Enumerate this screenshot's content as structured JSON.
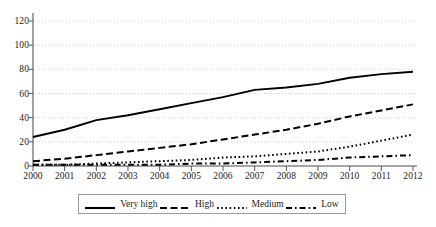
{
  "chart_data": {
    "type": "line",
    "title": "",
    "xlabel": "",
    "ylabel": "",
    "categories": [
      "2000",
      "2001",
      "2002",
      "2003",
      "2004",
      "2005",
      "2006",
      "2007",
      "2008",
      "2009",
      "2010",
      "2011",
      "2012"
    ],
    "x": [
      2000,
      2001,
      2002,
      2003,
      2004,
      2005,
      2006,
      2007,
      2008,
      2009,
      2010,
      2011,
      2012
    ],
    "xlim": [
      2000,
      2012
    ],
    "ylim": [
      0,
      120
    ],
    "yticks": [
      0,
      20,
      40,
      60,
      80,
      100,
      120
    ],
    "grid": "horizontal-dotted",
    "legend_position": "bottom",
    "series": [
      {
        "name": "Very high",
        "style": "solid",
        "color": "#000000",
        "values": [
          24,
          30,
          38,
          42,
          47,
          52,
          57,
          63,
          65,
          68,
          73,
          76,
          78
        ]
      },
      {
        "name": "High",
        "style": "dashed",
        "color": "#000000",
        "values": [
          4,
          6,
          9,
          12,
          15,
          18,
          22,
          26,
          30,
          35,
          41,
          46,
          51
        ]
      },
      {
        "name": "Medium",
        "style": "dotted",
        "color": "#000000",
        "values": [
          1,
          1,
          2,
          3,
          4,
          5,
          7,
          8,
          10,
          12,
          16,
          21,
          26
        ]
      },
      {
        "name": "Low",
        "style": "dashdot",
        "color": "#000000",
        "values": [
          1,
          1,
          1,
          1,
          1,
          2,
          2,
          3,
          4,
          5,
          7,
          8,
          9
        ]
      }
    ]
  },
  "axes": {
    "y_tick_labels": [
      "120",
      "100",
      "80",
      "60",
      "40",
      "20",
      "0"
    ],
    "x_tick_labels": [
      "2000",
      "2001",
      "2002",
      "2003",
      "2004",
      "2005",
      "2006",
      "2007",
      "2008",
      "2009",
      "2010",
      "2011",
      "2012"
    ]
  },
  "legend": {
    "items": [
      {
        "label": "Very high",
        "style": "solid"
      },
      {
        "label": "High",
        "style": "dashed"
      },
      {
        "label": "Medium",
        "style": "dotted"
      },
      {
        "label": "Low",
        "style": "dashdot"
      }
    ]
  },
  "colors": {
    "line": "#000000",
    "axis": "#555555",
    "grid": "#c8c8c8",
    "legend_border": "#9a9a9a",
    "background": "#ffffff",
    "text": "#1a1a1a"
  }
}
